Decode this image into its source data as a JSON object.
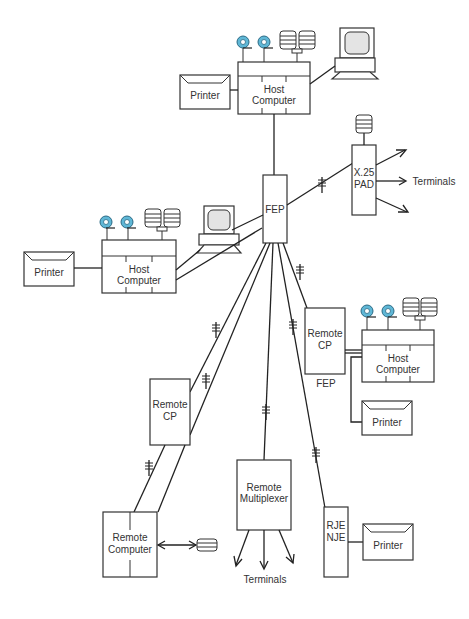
{
  "diagram": {
    "type": "network-topology",
    "nodes": {
      "host_top": {
        "label_line1": "Host",
        "label_line2": "Computer"
      },
      "printer_top": {
        "label": "Printer"
      },
      "fep_central": {
        "label": "FEP"
      },
      "x25_pad": {
        "label_line1": "X.25",
        "label_line2": "PAD"
      },
      "terminals_pad": {
        "label": "Terminals"
      },
      "host_left": {
        "label_line1": "Host",
        "label_line2": "Computer"
      },
      "printer_left": {
        "label": "Printer"
      },
      "remote_cp_right": {
        "label_line1": "Remote",
        "label_line2": "CP",
        "caption": "FEP"
      },
      "host_right": {
        "label_line1": "Host",
        "label_line2": "Computer"
      },
      "printer_right": {
        "label": "Printer"
      },
      "remote_cp_left": {
        "label_line1": "Remote",
        "label_line2": "CP"
      },
      "remote_computer": {
        "label_line1": "Remote",
        "label_line2": "Computer"
      },
      "remote_multiplexer": {
        "label_line1": "Remote",
        "label_line2": "Multiplexer"
      },
      "terminals_mux": {
        "label": "Terminals"
      },
      "rje_nje": {
        "label_line1": "RJE",
        "label_line2": "NJE"
      },
      "printer_rje": {
        "label": "Printer"
      }
    },
    "icons": [
      "tape-reel-icon",
      "disk-stack-icon",
      "terminal-monitor-icon",
      "modem-line-icon",
      "arrow-icon"
    ],
    "colors": {
      "tape_reel": "#5fb7d6",
      "line": "#222222",
      "background": "#ffffff"
    }
  }
}
